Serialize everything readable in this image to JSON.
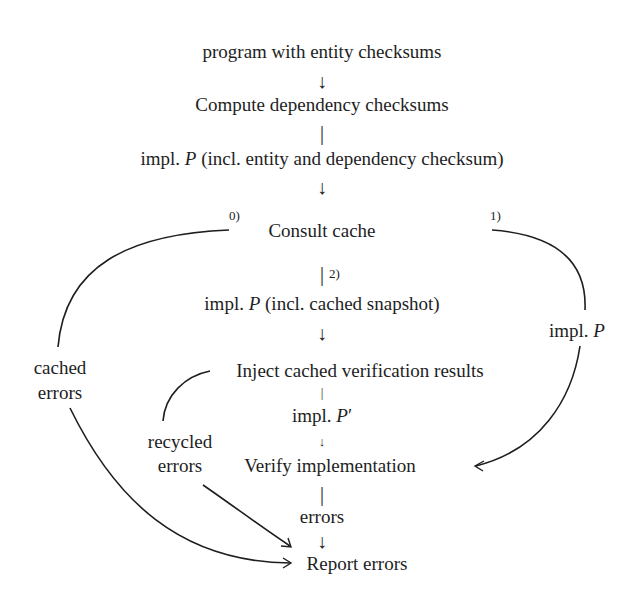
{
  "nodes": {
    "program": "program with entity checksums",
    "compute_deps": "Compute dependency checksums",
    "implP_full": "impl. P (incl. entity and dependency checksum)",
    "consult_cache": "Consult cache",
    "implP_snapshot": "impl. P (incl. cached snapshot)",
    "inject": "Inject cached verification results",
    "implP_prime": "impl. P′",
    "verify": "Verify implementation",
    "errors": "errors",
    "report": "Report errors"
  },
  "side_labels": {
    "cached_errors_1": "cached",
    "cached_errors_2": "errors",
    "recycled_errors_1": "recycled",
    "recycled_errors_2": "errors",
    "implP_right": "impl. P"
  },
  "branch_labels": {
    "b0": "0)",
    "b1": "1)",
    "b2": "2)"
  },
  "glyphs": {
    "down_arrow": "↓",
    "bar": "|",
    "small_arrow": "↓"
  },
  "colors": {
    "ink": "#1e1e1e",
    "background": "#ffffff"
  }
}
